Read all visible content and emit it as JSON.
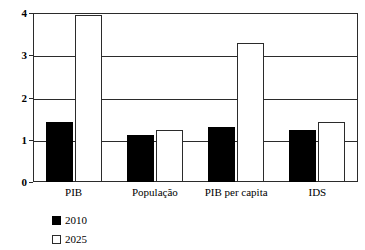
{
  "chart_data": {
    "type": "bar",
    "title": "",
    "xlabel": "",
    "ylabel": "",
    "ylim": [
      0,
      4
    ],
    "yticks": [
      "0",
      "1",
      "2",
      "3",
      "4"
    ],
    "grid": true,
    "legend_position": "bottom-left",
    "categories": [
      "PIB",
      "População",
      "PIB per capita",
      "IDS"
    ],
    "series": [
      {
        "name": "2010",
        "color": "#000000",
        "style": "filled",
        "values": [
          1.42,
          1.12,
          1.3,
          1.24
        ]
      },
      {
        "name": "2025",
        "color": "#ffffff",
        "style": "hollow",
        "values": [
          3.95,
          1.22,
          3.28,
          1.42
        ]
      }
    ]
  },
  "legend": {
    "entries": [
      {
        "label": "2010",
        "swatch": "filled-square-icon"
      },
      {
        "label": "2025",
        "swatch": "hollow-square-icon"
      }
    ]
  }
}
